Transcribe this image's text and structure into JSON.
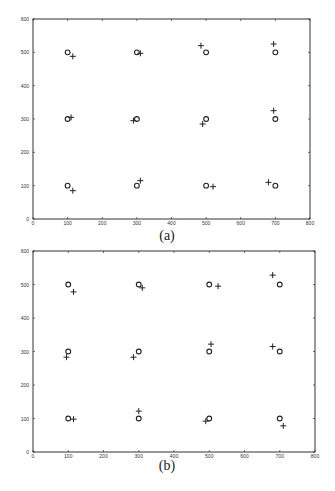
{
  "figure": {
    "panels": [
      {
        "caption": "(a)"
      },
      {
        "caption": "(b)"
      }
    ]
  },
  "chart_data": [
    {
      "type": "scatter",
      "title": "",
      "caption": "(a)",
      "xlabel": "",
      "ylabel": "",
      "xlim": [
        0,
        800
      ],
      "ylim": [
        0,
        600
      ],
      "xticks": [
        0,
        100,
        200,
        300,
        400,
        500,
        600,
        700,
        800
      ],
      "yticks": [
        0,
        100,
        200,
        300,
        400,
        500,
        600
      ],
      "grid": false,
      "legend": null,
      "series": [
        {
          "name": "circles",
          "marker": "o",
          "points": [
            [
              100,
              100
            ],
            [
              100,
              300
            ],
            [
              100,
              500
            ],
            [
              300,
              100
            ],
            [
              300,
              300
            ],
            [
              300,
              500
            ],
            [
              500,
              100
            ],
            [
              500,
              300
            ],
            [
              500,
              500
            ],
            [
              700,
              100
            ],
            [
              700,
              300
            ],
            [
              700,
              500
            ]
          ]
        },
        {
          "name": "crosses",
          "marker": "+",
          "points": [
            [
              115,
              85
            ],
            [
              110,
              305
            ],
            [
              115,
              488
            ],
            [
              310,
              115
            ],
            [
              290,
              295
            ],
            [
              310,
              497
            ],
            [
              520,
              97
            ],
            [
              490,
              285
            ],
            [
              485,
              520
            ],
            [
              680,
              110
            ],
            [
              695,
              325
            ],
            [
              695,
              525
            ]
          ]
        }
      ]
    },
    {
      "type": "scatter",
      "title": "",
      "caption": "(b)",
      "xlabel": "",
      "ylabel": "",
      "xlim": [
        0,
        800
      ],
      "ylim": [
        0,
        600
      ],
      "xticks": [
        0,
        100,
        200,
        300,
        400,
        500,
        600,
        700,
        800
      ],
      "yticks": [
        0,
        100,
        200,
        300,
        400,
        500,
        600
      ],
      "grid": false,
      "legend": null,
      "series": [
        {
          "name": "circles",
          "marker": "o",
          "points": [
            [
              100,
              100
            ],
            [
              100,
              300
            ],
            [
              100,
              500
            ],
            [
              300,
              100
            ],
            [
              300,
              300
            ],
            [
              300,
              500
            ],
            [
              500,
              100
            ],
            [
              500,
              300
            ],
            [
              500,
              500
            ],
            [
              700,
              100
            ],
            [
              700,
              300
            ],
            [
              700,
              500
            ]
          ]
        },
        {
          "name": "crosses",
          "marker": "+",
          "points": [
            [
              115,
              98
            ],
            [
              95,
              283
            ],
            [
              115,
              478
            ],
            [
              300,
              122
            ],
            [
              285,
              283
            ],
            [
              310,
              490
            ],
            [
              490,
              92
            ],
            [
              505,
              322
            ],
            [
              525,
              495
            ],
            [
              710,
              78
            ],
            [
              680,
              315
            ],
            [
              680,
              528
            ]
          ]
        }
      ]
    }
  ]
}
